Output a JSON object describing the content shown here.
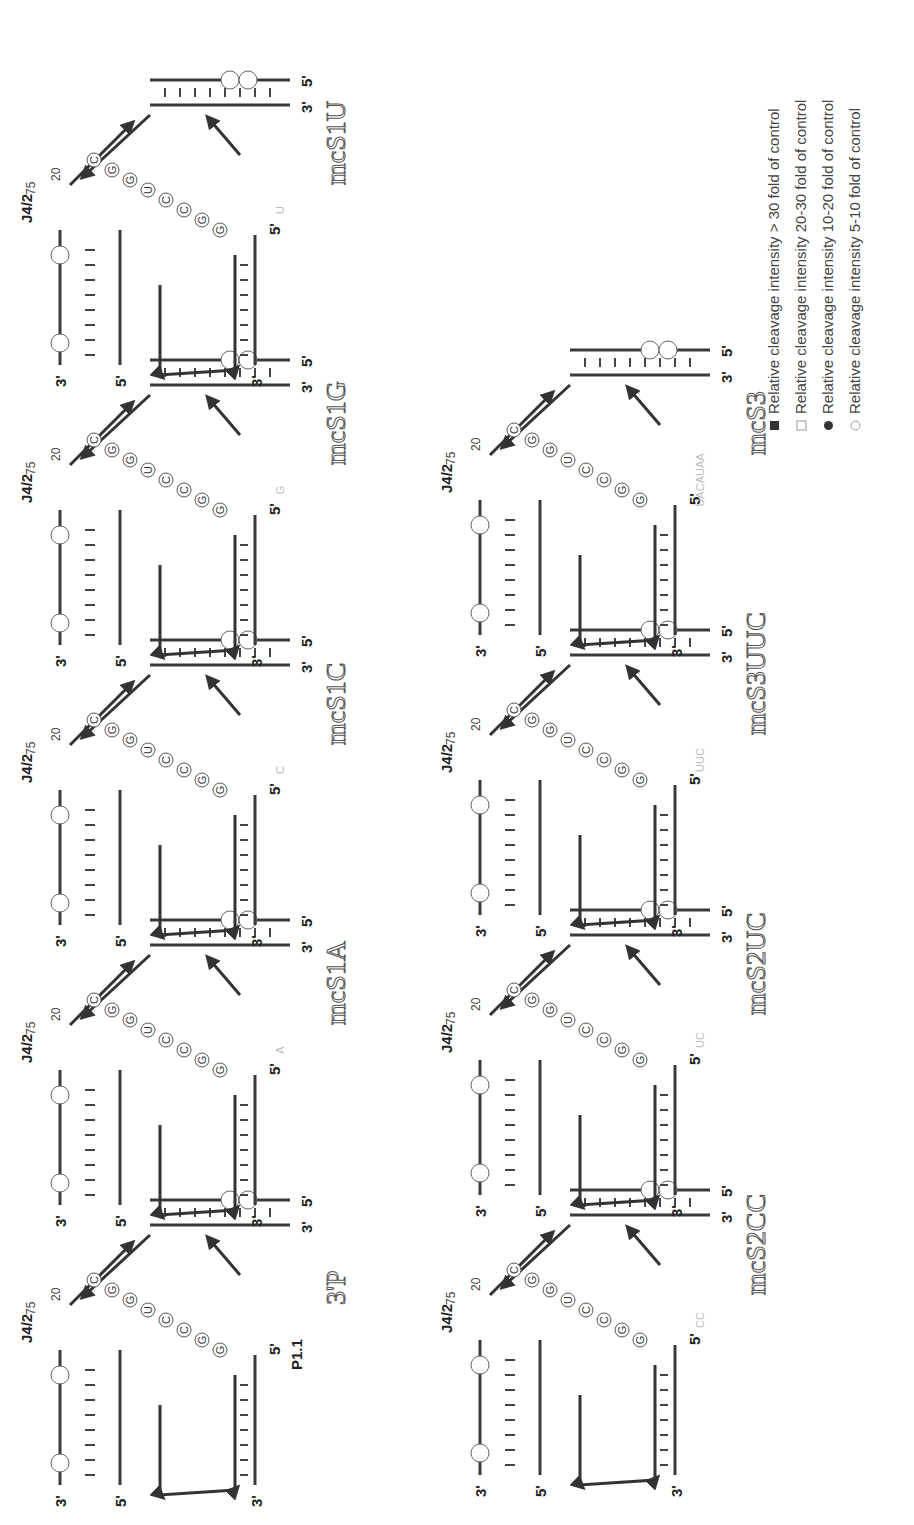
{
  "figure": {
    "orientation": "rotated 90 degrees counter-clockwise",
    "common_labels": {
      "junction": "J4/2",
      "position_20": "20",
      "position_75": "75",
      "five_prime": "5'",
      "three_prime": "3'"
    },
    "panels": [
      {
        "id": "3P",
        "title": "3'P",
        "extra_label": "P1.1",
        "five_prime_overhang": "",
        "row": 1,
        "col": 1
      },
      {
        "id": "mcS1A",
        "title": "mcS1A",
        "five_prime_overhang": "A",
        "row": 1,
        "col": 2
      },
      {
        "id": "mcS1C",
        "title": "mcS1C",
        "five_prime_overhang": "C",
        "row": 1,
        "col": 3
      },
      {
        "id": "mcS1G",
        "title": "mcS1G",
        "five_prime_overhang": "G",
        "row": 1,
        "col": 4
      },
      {
        "id": "mcS1U",
        "title": "mcS1U",
        "five_prime_overhang": "U",
        "row": 1,
        "col": 5
      },
      {
        "id": "mcS2CC",
        "title": "mcS2CC",
        "five_prime_overhang": "CC",
        "row": 2,
        "col": 1
      },
      {
        "id": "mcS2UC",
        "title": "mcS2UC",
        "five_prime_overhang": "UC",
        "row": 2,
        "col": 2
      },
      {
        "id": "mcS3UUC",
        "title": "mcS3UUC",
        "five_prime_overhang": "UUC",
        "row": 2,
        "col": 3
      },
      {
        "id": "mcS3",
        "title": "mcS3",
        "five_prime_overhang": "UACAUAA",
        "row": 2,
        "col": 4
      }
    ],
    "legend": {
      "items": [
        {
          "symbol": "filled-square",
          "label": "Relative cleavage intensity > 30 fold of control"
        },
        {
          "symbol": "open-square",
          "label": "Relative cleavage intensity 20-30 fold of control"
        },
        {
          "symbol": "filled-circle",
          "label": "Relative cleavage intensity 10-20 fold of control"
        },
        {
          "symbol": "open-circle",
          "label": "Relative cleavage intensity 5-10 fold of control"
        }
      ]
    }
  }
}
